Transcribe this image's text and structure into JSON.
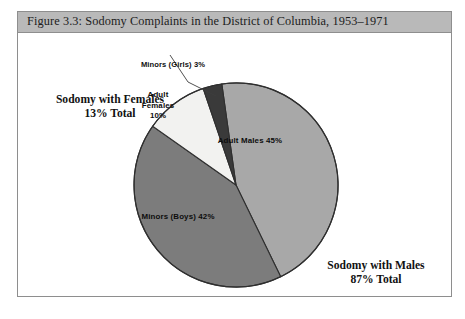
{
  "figure": {
    "title": "Figure 3.3: Sodomy Complaints in the District of Columbia, 1953–1971",
    "frame_color": "#8e8e8e",
    "title_band_color": "#b9b9b9",
    "background_color": "#ffffff"
  },
  "callouts": {
    "females_total": "Sodomy with Females\n13% Total",
    "females_total_line1": "Sodomy with Females",
    "females_total_line2": "13% Total",
    "males_total_line1": "Sodomy with Males",
    "males_total_line2": "87% Total",
    "minors_girls": "Minors (Girls) 3%"
  },
  "wedge_labels": {
    "adult_males": "Adult Males 45%",
    "minors_boys": "Minors (Boys) 42%",
    "adult_females_line1": "Adult",
    "adult_females_line2": "Females",
    "adult_females_line3": "10%"
  },
  "chart_data": {
    "type": "pie",
    "title": "Figure 3.3: Sodomy Complaints in the District of Columbia, 1953–1971",
    "xlabel": "",
    "ylabel": "",
    "legend_position": "none",
    "grid": false,
    "units": "percent",
    "start_angle_deg": -8,
    "direction": "clockwise",
    "categories": [
      "Adult Males",
      "Minors (Boys)",
      "Adult Females",
      "Minors (Girls)"
    ],
    "values": [
      45,
      42,
      10,
      3
    ],
    "labels": [
      "Adult Males 45%",
      "Minors (Boys) 42%",
      "Adult Females 10%",
      "Minors (Girls) 3%"
    ],
    "colors": [
      "#a8a8a8",
      "#7c7c7c",
      "#f2f2f0",
      "#3a3a3a"
    ],
    "slice_edge_color": "#2f2f2f",
    "groups": [
      {
        "name": "Sodomy with Males",
        "total": 87,
        "label": "Sodomy with Males 87% Total",
        "members": [
          "Adult Males",
          "Minors (Boys)"
        ]
      },
      {
        "name": "Sodomy with Females",
        "total": 13,
        "label": "Sodomy with Females 13% Total",
        "members": [
          "Adult Females",
          "Minors (Girls)"
        ]
      }
    ],
    "annotations": [
      {
        "text": "Minors (Girls) 3%",
        "type": "leader-line",
        "target": "Minors (Girls)"
      },
      {
        "text": "Sodomy with Females 13% Total",
        "type": "group-total"
      },
      {
        "text": "Sodomy with Males 87% Total",
        "type": "group-total"
      }
    ]
  }
}
